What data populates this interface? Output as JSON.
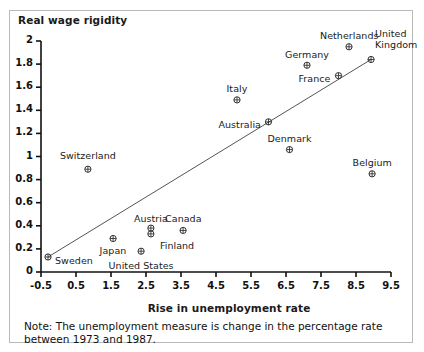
{
  "chart_data": {
    "type": "scatter",
    "title": "",
    "xlabel": "Rise in unemployment rate",
    "ylabel": "Real wage rigidity",
    "xlim": [
      -0.5,
      9.5
    ],
    "ylim": [
      0,
      2
    ],
    "xticks": [
      "-0.5",
      "0.5",
      "1.5",
      "2.5",
      "3.5",
      "4.5",
      "5.5",
      "6.5",
      "7.5",
      "8.5",
      "9.5"
    ],
    "yticks": [
      "0",
      "0.2",
      "0.4",
      "0.6",
      "0.8",
      "1",
      "1.2",
      "1.4",
      "1.6",
      "1.8",
      "2"
    ],
    "grid": false,
    "legend": "none",
    "marker_style": "circle-with-cross",
    "points": [
      {
        "label": "Sweden",
        "x": -0.3,
        "y": 0.13,
        "label_dx": 7,
        "label_dy": 4,
        "anchor": "left"
      },
      {
        "label": "Switzerland",
        "x": 0.84,
        "y": 0.89,
        "label_dx": 0,
        "label_dy": -14,
        "anchor": "center"
      },
      {
        "label": "Japan",
        "x": 1.56,
        "y": 0.29,
        "label_dx": 0,
        "label_dy": 12,
        "anchor": "center"
      },
      {
        "label": "United States",
        "x": 2.36,
        "y": 0.18,
        "label_dx": 0,
        "label_dy": 14,
        "anchor": "center"
      },
      {
        "label": "Austria",
        "x": 2.64,
        "y": 0.38,
        "label_dx": 0,
        "label_dy": -10,
        "anchor": "center"
      },
      {
        "label": "Finland",
        "x": 2.64,
        "y": 0.33,
        "label_dx": 9,
        "label_dy": 12,
        "anchor": "left"
      },
      {
        "label": "Canada",
        "x": 3.56,
        "y": 0.36,
        "label_dx": 0,
        "label_dy": -12,
        "anchor": "center"
      },
      {
        "label": "Italy",
        "x": 5.1,
        "y": 1.49,
        "label_dx": 0,
        "label_dy": -11,
        "anchor": "center"
      },
      {
        "label": "Australia",
        "x": 6.0,
        "y": 1.3,
        "label_dx": -8,
        "label_dy": 3,
        "anchor": "right"
      },
      {
        "label": "Denmark",
        "x": 6.6,
        "y": 1.06,
        "label_dx": 0,
        "label_dy": -11,
        "anchor": "center"
      },
      {
        "label": "Germany",
        "x": 7.1,
        "y": 1.79,
        "label_dx": 0,
        "label_dy": -11,
        "anchor": "center"
      },
      {
        "label": "France",
        "x": 8.0,
        "y": 1.7,
        "label_dx": -8,
        "label_dy": 3,
        "anchor": "right"
      },
      {
        "label": "Netherlands",
        "x": 8.3,
        "y": 1.95,
        "label_dx": 0,
        "label_dy": -11,
        "anchor": "center"
      },
      {
        "label": "United Kingdom",
        "x": 8.93,
        "y": 1.84,
        "label_dx": 4,
        "label_dy": -20,
        "anchor": "left",
        "wrap": [
          "United",
          "Kingdom"
        ]
      },
      {
        "label": "Belgium",
        "x": 8.96,
        "y": 0.85,
        "label_dx": 0,
        "label_dy": -11,
        "anchor": "center"
      }
    ],
    "trendline": {
      "x0": -0.3,
      "y0": 0.13,
      "x1": 8.93,
      "y1": 1.84
    }
  },
  "note": {
    "text": "Note: The unemployment measure is change in the percentage rate between 1973 and 1987."
  }
}
